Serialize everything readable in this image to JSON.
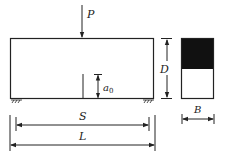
{
  "diagram": {
    "labels": {
      "load": "P",
      "crack_depth": "a",
      "crack_depth_sub": "0",
      "beam_depth": "D",
      "span": "S",
      "length": "L",
      "width": "B"
    },
    "colors": {
      "line": "#222222",
      "section_fill_top": "#111111",
      "background": "#ffffff"
    }
  }
}
